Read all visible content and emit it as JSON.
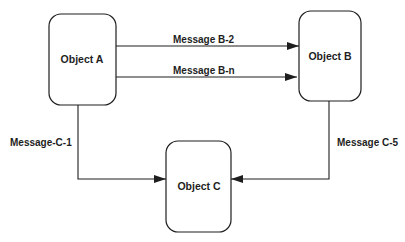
{
  "diagram": {
    "type": "message-flow",
    "nodes": [
      {
        "id": "A",
        "label": "Object A"
      },
      {
        "id": "B",
        "label": "Object B"
      },
      {
        "id": "C",
        "label": "Object C"
      }
    ],
    "edges": [
      {
        "from": "A",
        "to": "B",
        "label": "Message B-2"
      },
      {
        "from": "A",
        "to": "B",
        "label": "Message B-n"
      },
      {
        "from": "A",
        "to": "C",
        "label": "Message-C-1"
      },
      {
        "from": "B",
        "to": "C",
        "label": "Message C-5"
      }
    ]
  },
  "colors": {
    "stroke": "#1e1e1e",
    "background": "#ffffff"
  }
}
